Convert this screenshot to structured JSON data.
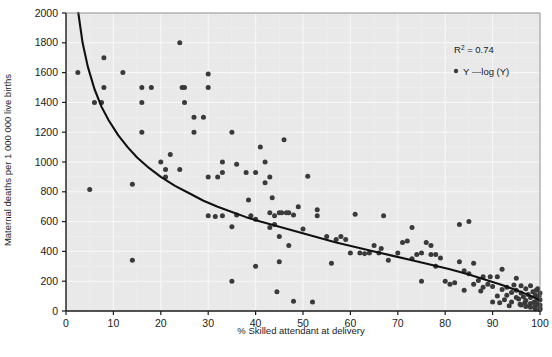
{
  "chart_data": {
    "type": "scatter",
    "title": "",
    "xlabel": "% Skilled attendant at delivery",
    "ylabel": "Maternal deaths per 1 000 000 live births",
    "xlim": [
      0,
      100
    ],
    "ylim": [
      0,
      2000
    ],
    "xticks": [
      0,
      10,
      20,
      30,
      40,
      50,
      60,
      70,
      80,
      90,
      100
    ],
    "yticks": [
      0,
      200,
      400,
      600,
      800,
      1000,
      1200,
      1400,
      1600,
      1800,
      2000
    ],
    "xtick_labels": [
      "0",
      "10",
      "20",
      "30",
      "40",
      "50",
      "60",
      "70",
      "80",
      "90",
      "100"
    ],
    "ytick_labels": [
      "0",
      "200",
      "400",
      "600",
      "800",
      "1000",
      "1200",
      "1400",
      "1600",
      "1800",
      "2000"
    ],
    "grid": true,
    "grid_minor": true,
    "plot_background": "#e9e9e9",
    "grid_color": "#f7f7f7",
    "minor_grid_color": "#efefef",
    "point_color": "#3a3a3a",
    "line_color": "#111111",
    "legend_position": "top-right",
    "annotations": [
      {
        "text": "R",
        "sup": "2",
        "rest": " = 0.74"
      }
    ],
    "legend": [
      {
        "marker": "dot-line",
        "label": "Y —log (Y)"
      }
    ],
    "series": [
      {
        "name": "Y",
        "type": "scatter",
        "points": [
          [
            2.5,
            1600
          ],
          [
            5,
            815
          ],
          [
            6,
            1400
          ],
          [
            7.5,
            1400
          ],
          [
            8,
            1700
          ],
          [
            8,
            1500
          ],
          [
            12,
            1600
          ],
          [
            14,
            340
          ],
          [
            14,
            850
          ],
          [
            16,
            1500
          ],
          [
            16,
            1400
          ],
          [
            16,
            1200
          ],
          [
            18,
            1500
          ],
          [
            20,
            1000
          ],
          [
            21,
            900
          ],
          [
            21,
            950
          ],
          [
            22,
            1050
          ],
          [
            24,
            1800
          ],
          [
            24,
            950
          ],
          [
            24.5,
            1500
          ],
          [
            25,
            1500
          ],
          [
            25,
            1400
          ],
          [
            27,
            1200
          ],
          [
            27,
            1300
          ],
          [
            29,
            1300
          ],
          [
            30,
            640
          ],
          [
            30,
            900
          ],
          [
            30,
            1500
          ],
          [
            30,
            1590
          ],
          [
            31.5,
            635
          ],
          [
            32,
            900
          ],
          [
            33,
            640
          ],
          [
            33,
            1000
          ],
          [
            33,
            930
          ],
          [
            35,
            200
          ],
          [
            35,
            565
          ],
          [
            35,
            1200
          ],
          [
            36,
            985
          ],
          [
            36,
            645
          ],
          [
            38,
            930
          ],
          [
            38.5,
            745
          ],
          [
            39,
            640
          ],
          [
            40,
            300
          ],
          [
            40,
            615
          ],
          [
            40,
            930
          ],
          [
            41,
            1100
          ],
          [
            42,
            1000
          ],
          [
            42,
            860
          ],
          [
            43,
            900
          ],
          [
            43,
            660
          ],
          [
            43,
            560
          ],
          [
            43.5,
            760
          ],
          [
            44,
            640
          ],
          [
            44,
            580
          ],
          [
            44.5,
            130
          ],
          [
            45,
            660
          ],
          [
            45,
            330
          ],
          [
            45,
            500
          ],
          [
            45.5,
            660
          ],
          [
            46,
            1150
          ],
          [
            46.5,
            660
          ],
          [
            47,
            660
          ],
          [
            47,
            440
          ],
          [
            48,
            65
          ],
          [
            48,
            645
          ],
          [
            49,
            700
          ],
          [
            50,
            550
          ],
          [
            51,
            905
          ],
          [
            52,
            60
          ],
          [
            53,
            640
          ],
          [
            53,
            680
          ],
          [
            55,
            500
          ],
          [
            56,
            320
          ],
          [
            57,
            480
          ],
          [
            58,
            500
          ],
          [
            59,
            480
          ],
          [
            60,
            390
          ],
          [
            61,
            650
          ],
          [
            62,
            390
          ],
          [
            63,
            385
          ],
          [
            64,
            390
          ],
          [
            65,
            440
          ],
          [
            66,
            390
          ],
          [
            66.5,
            420
          ],
          [
            67,
            640
          ],
          [
            68,
            340
          ],
          [
            70,
            390
          ],
          [
            71,
            460
          ],
          [
            72,
            470
          ],
          [
            73,
            350
          ],
          [
            73,
            560
          ],
          [
            74,
            380
          ],
          [
            75,
            200
          ],
          [
            75,
            390
          ],
          [
            76,
            460
          ],
          [
            77,
            440
          ],
          [
            77,
            380
          ],
          [
            78,
            380
          ],
          [
            78,
            300
          ],
          [
            79,
            355
          ],
          [
            80,
            200
          ],
          [
            81,
            180
          ],
          [
            82,
            190
          ],
          [
            83,
            580
          ],
          [
            83,
            330
          ],
          [
            84,
            140
          ],
          [
            84,
            270
          ],
          [
            85,
            250
          ],
          [
            85,
            600
          ],
          [
            86,
            320
          ],
          [
            86,
            180
          ],
          [
            87,
            205
          ],
          [
            88,
            230
          ],
          [
            88,
            160
          ],
          [
            89,
            180
          ],
          [
            90,
            165
          ],
          [
            90,
            60
          ],
          [
            91,
            230
          ],
          [
            91,
            100
          ],
          [
            92,
            145
          ],
          [
            92,
            280
          ],
          [
            93,
            105
          ],
          [
            93,
            160
          ],
          [
            94,
            125
          ],
          [
            94,
            60
          ],
          [
            95,
            140
          ],
          [
            95,
            220
          ],
          [
            95,
            90
          ],
          [
            95.5,
            80
          ],
          [
            96,
            170
          ],
          [
            96,
            120
          ],
          [
            96,
            40
          ],
          [
            96.5,
            95
          ],
          [
            97,
            150
          ],
          [
            97,
            70
          ],
          [
            97,
            30
          ],
          [
            97.5,
            110
          ],
          [
            98,
            170
          ],
          [
            98,
            90
          ],
          [
            98,
            50
          ],
          [
            98,
            25
          ],
          [
            98.5,
            130
          ],
          [
            99,
            105
          ],
          [
            99,
            60
          ],
          [
            99,
            35
          ],
          [
            99,
            15
          ],
          [
            99.5,
            150
          ],
          [
            99.5,
            85
          ],
          [
            99.5,
            45
          ],
          [
            100,
            120
          ],
          [
            100,
            75
          ],
          [
            100,
            40
          ],
          [
            100,
            20
          ],
          [
            100,
            10
          ],
          [
            99.8,
            100
          ],
          [
            99.2,
            140
          ],
          [
            98.8,
            60
          ],
          [
            97.8,
            40
          ],
          [
            96.8,
            55
          ],
          [
            95.8,
            45
          ],
          [
            94.5,
            175
          ],
          [
            93.5,
            35
          ],
          [
            92.5,
            75
          ],
          [
            91.5,
            55
          ],
          [
            89.5,
            230
          ],
          [
            87.5,
            135
          ]
        ]
      },
      {
        "name": "log (Y)",
        "type": "line",
        "description": "logarithmic fit curve, decreasing from ~2000 near x=2.5 to ~60 at x=100",
        "points": [
          [
            2.6,
            2000
          ],
          [
            3.5,
            1800
          ],
          [
            4.6,
            1640
          ],
          [
            6,
            1490
          ],
          [
            7.5,
            1370
          ],
          [
            9,
            1280
          ],
          [
            11,
            1180
          ],
          [
            13,
            1100
          ],
          [
            15,
            1030
          ],
          [
            17.5,
            960
          ],
          [
            20,
            900
          ],
          [
            23,
            840
          ],
          [
            26,
            790
          ],
          [
            29,
            740
          ],
          [
            32,
            700
          ],
          [
            35,
            665
          ],
          [
            38,
            630
          ],
          [
            41,
            600
          ],
          [
            45,
            565
          ],
          [
            49,
            530
          ],
          [
            53,
            495
          ],
          [
            57,
            460
          ],
          [
            61,
            430
          ],
          [
            65,
            400
          ],
          [
            69,
            370
          ],
          [
            73,
            340
          ],
          [
            77,
            310
          ],
          [
            81,
            280
          ],
          [
            85,
            245
          ],
          [
            89,
            205
          ],
          [
            92,
            175
          ],
          [
            95,
            140
          ],
          [
            97,
            115
          ],
          [
            98.5,
            95
          ],
          [
            100,
            70
          ]
        ]
      }
    ]
  },
  "axis": {
    "x_title": "% Skilled attendant at delivery",
    "y_title": "Maternal deaths per 1 000 000 live births"
  },
  "legend": {
    "r2_prefix": "R",
    "r2_sup": "2",
    "r2_value": " = 0.74",
    "series_label": "Y —log (Y)"
  }
}
